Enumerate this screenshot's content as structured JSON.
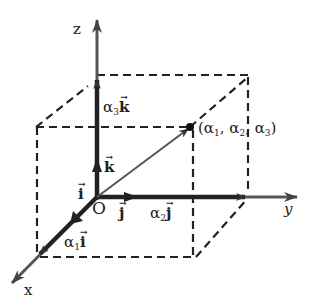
{
  "diagram": {
    "colors": {
      "stroke": "#333333",
      "axis": "#555555",
      "text": "#222222",
      "background": "#ffffff"
    },
    "axes": {
      "x": {
        "label": "x"
      },
      "y": {
        "label": "y"
      },
      "z": {
        "label": "z"
      },
      "origin": {
        "label": "O"
      }
    },
    "unit_vectors": {
      "i": {
        "symbol": "i"
      },
      "j": {
        "symbol": "j"
      },
      "k": {
        "symbol": "k"
      }
    },
    "components": {
      "a1i": {
        "coef": "α",
        "sub": "1",
        "symbol": "i"
      },
      "a2j": {
        "coef": "α",
        "sub": "2",
        "symbol": "j"
      },
      "a3k": {
        "coef": "α",
        "sub": "3",
        "symbol": "k"
      }
    },
    "point": {
      "label": "(α₁, α₂, α₃)",
      "open": "(α",
      "s1": "1",
      "mid1": ", α",
      "s2": "2",
      "mid2": ", α",
      "s3": "3",
      "close": ")"
    },
    "vector_arrow_glyph": "→"
  }
}
